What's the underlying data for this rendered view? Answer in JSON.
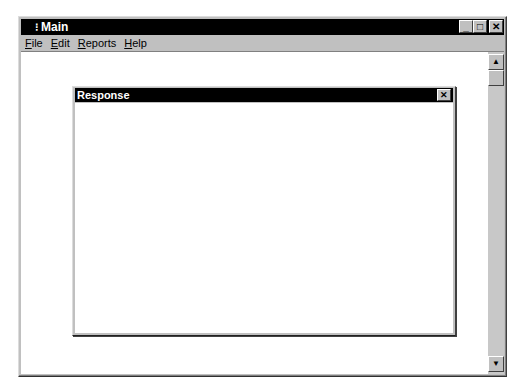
{
  "main_window": {
    "title": "Main",
    "sys_icon": "⁝",
    "controls": {
      "minimize": "_",
      "maximize": "□",
      "close": "✕"
    },
    "menu": [
      {
        "underline": "F",
        "rest": "ile"
      },
      {
        "underline": "E",
        "rest": "dit"
      },
      {
        "underline": "R",
        "rest": "eports"
      },
      {
        "underline": "H",
        "rest": "elp"
      }
    ],
    "scrollbar": {
      "up": "▲",
      "down": "▼"
    }
  },
  "response_window": {
    "title": "Response",
    "close": "✕"
  }
}
